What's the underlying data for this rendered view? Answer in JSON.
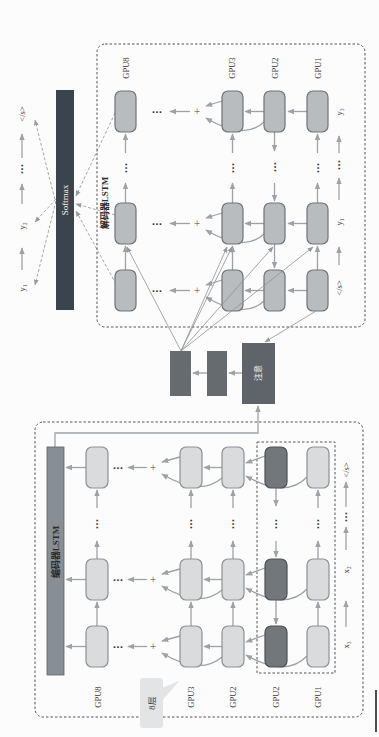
{
  "softmax": {
    "label": "Softmax"
  },
  "outputs": {
    "labels": [
      "y₁",
      "y₂",
      "</s>"
    ],
    "ellipsis": "···"
  },
  "decoder": {
    "title": "解码器LSTM",
    "layers": [
      "GPU8",
      "GPU3",
      "GPU2",
      "GPU1"
    ],
    "inputs": [
      "</s>",
      "y₁",
      "y₃"
    ],
    "plus": "+",
    "ellipsis": "···"
  },
  "attention": {
    "label": "注意"
  },
  "encoder": {
    "title": "编码器LSTM",
    "layers": [
      "GPU8",
      "GPU3",
      "GPU2",
      "GPU2",
      "GPU1"
    ],
    "inputs": [
      "x₃",
      "x₂",
      "</s>"
    ],
    "callout": "8层",
    "plus": "+",
    "ellipsis": "···"
  },
  "colors": {
    "softmax": "#3b434c",
    "decoder_cell": "#b9bcbf",
    "encoder_cell": "#d9dbdd",
    "encoder_cell_backward": "#72777c",
    "encoder_bar": "#878e95",
    "attention": "#5e646a",
    "arrow": "#9ea2a6"
  }
}
